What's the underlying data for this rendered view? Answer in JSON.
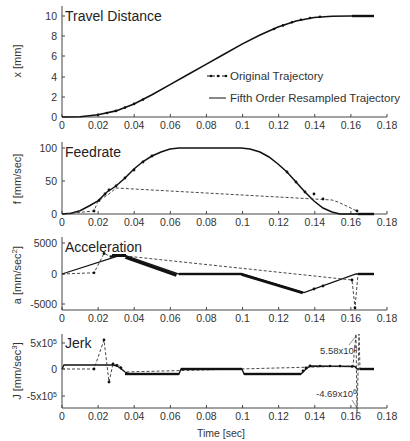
{
  "chart_data": [
    {
      "type": "line",
      "title": "Travel Distance",
      "xlabel": "",
      "ylabel": "x [mm]",
      "xlim": [
        0,
        0.18
      ],
      "ylim": [
        0,
        10.5
      ],
      "xticks": [
        "0",
        "0.02",
        "0.04",
        "0.06",
        "0.08",
        "0.1",
        "0.12",
        "0.14",
        "0.16",
        "0.18"
      ],
      "yticks": [
        "0",
        "2",
        "4",
        "6",
        "8",
        "10"
      ],
      "legend": [
        "Original Trajectory",
        "Fifth Order Resampled Trajectory"
      ],
      "legend_position": "center-right",
      "series": [
        {
          "name": "Original Trajectory",
          "style": "dashed-dot-markers",
          "x": [
            0,
            0.01,
            0.02,
            0.03,
            0.04,
            0.05,
            0.06,
            0.07,
            0.08,
            0.09,
            0.1,
            0.11,
            0.12,
            0.13,
            0.14,
            0.15,
            0.16,
            0.172
          ],
          "y": [
            0,
            0.03,
            0.22,
            0.6,
            1.3,
            2.2,
            3.2,
            4.2,
            5.2,
            6.2,
            7.2,
            8.1,
            8.9,
            9.5,
            9.85,
            9.98,
            10,
            10
          ]
        },
        {
          "name": "Fifth Order Resampled Trajectory",
          "style": "solid",
          "x": [
            0,
            0.01,
            0.02,
            0.03,
            0.04,
            0.05,
            0.06,
            0.07,
            0.08,
            0.09,
            0.1,
            0.11,
            0.12,
            0.13,
            0.14,
            0.15,
            0.16,
            0.172
          ],
          "y": [
            0,
            0.03,
            0.22,
            0.6,
            1.3,
            2.2,
            3.2,
            4.2,
            5.2,
            6.2,
            7.2,
            8.1,
            8.9,
            9.5,
            9.85,
            9.98,
            10,
            10
          ]
        }
      ]
    },
    {
      "type": "line",
      "title": "Feedrate",
      "xlabel": "",
      "ylabel": "f [mm/sec]",
      "xlim": [
        0,
        0.18
      ],
      "ylim": [
        0,
        110
      ],
      "xticks": [
        "0",
        "0.02",
        "0.04",
        "0.06",
        "0.08",
        "0.1",
        "0.12",
        "0.14",
        "0.16",
        "0.18"
      ],
      "yticks": [
        "0",
        "50",
        "100"
      ],
      "series": [
        {
          "name": "Original Trajectory",
          "style": "dashed-dot-markers",
          "x": [
            0,
            0.018,
            0.023,
            0.026,
            0.03,
            0.035,
            0.04,
            0.05,
            0.06,
            0.065,
            0.08,
            0.1,
            0.105,
            0.115,
            0.125,
            0.13,
            0.135,
            0.14,
            0.145,
            0.164,
            0.172
          ],
          "y": [
            0,
            5,
            20,
            30,
            40,
            55,
            70,
            90,
            99,
            100,
            100,
            100,
            98,
            88,
            72,
            62,
            50,
            30,
            22,
            5,
            0
          ]
        },
        {
          "name": "Fifth Order Resampled Trajectory",
          "style": "solid",
          "x": [
            0,
            0.005,
            0.01,
            0.02,
            0.03,
            0.04,
            0.05,
            0.06,
            0.065,
            0.08,
            0.1,
            0.105,
            0.115,
            0.125,
            0.135,
            0.145,
            0.155,
            0.16,
            0.172
          ],
          "y": [
            0,
            1,
            5,
            20,
            42,
            68,
            88,
            99,
            100,
            100,
            100,
            98,
            88,
            70,
            45,
            20,
            5,
            0,
            0
          ]
        }
      ]
    },
    {
      "type": "line",
      "title": "Acceleration",
      "xlabel": "",
      "ylabel": "a [mm/sec²]",
      "xlim": [
        0,
        0.18
      ],
      "ylim": [
        -6000,
        5000
      ],
      "xticks": [
        "0",
        "0.02",
        "0.04",
        "0.06",
        "0.08",
        "0.1",
        "0.12",
        "0.14",
        "0.16",
        "0.18"
      ],
      "yticks": [
        "-5000",
        "0",
        "5000"
      ],
      "series": [
        {
          "name": "Original Trajectory",
          "style": "dashed-dot-markers",
          "x": [
            0,
            0.018,
            0.019,
            0.023,
            0.027,
            0.032,
            0.035,
            0.065,
            0.1,
            0.134,
            0.145,
            0.163,
            0.164,
            0.165,
            0.172
          ],
          "y": [
            0,
            200,
            800,
            3300,
            2800,
            3000,
            3000,
            0,
            0,
            -3000,
            -2200,
            -900,
            -6000,
            0,
            0
          ]
        },
        {
          "name": "Fifth Order Resampled Trajectory",
          "style": "solid",
          "x": [
            0,
            0.032,
            0.035,
            0.065,
            0.1,
            0.134,
            0.163,
            0.172
          ],
          "y": [
            0,
            3000,
            3000,
            0,
            0,
            -3000,
            0,
            0
          ]
        }
      ]
    },
    {
      "type": "line",
      "title": "Jerk",
      "xlabel": "Time [sec]",
      "ylabel": "J [mm/sec³]",
      "xlim": [
        0,
        0.18
      ],
      "ylim": [
        -700000.0,
        700000.0
      ],
      "xticks": [
        "0",
        "0.02",
        "0.04",
        "0.06",
        "0.08",
        "0.1",
        "0.12",
        "0.14",
        "0.16",
        "0.18"
      ],
      "yticks": [
        "-5x10⁵",
        "0",
        "5x10⁵"
      ],
      "annotations": [
        "5.58x10⁶",
        "-4.69x10⁶"
      ],
      "series": [
        {
          "name": "Original Trajectory",
          "style": "dashed-dot-markers",
          "x": [
            0,
            0.018,
            0.023,
            0.026,
            0.029,
            0.032,
            0.037,
            0.065,
            0.066,
            0.1,
            0.101,
            0.132,
            0.137,
            0.16,
            0.163,
            0.164,
            0.165,
            0.166,
            0.172
          ],
          "y": [
            0,
            0,
            550000,
            -250000,
            100000,
            50000,
            -100000,
            -100000,
            0,
            0,
            -100000,
            -100000,
            100000,
            80000,
            5580000,
            -4690000,
            5580000,
            0,
            0
          ]
        },
        {
          "name": "Fifth Order Resampled Trajectory",
          "style": "solid",
          "x": [
            0,
            0.001,
            0.028,
            0.037,
            0.065,
            0.066,
            0.1,
            0.101,
            0.132,
            0.137,
            0.163,
            0.164,
            0.172
          ],
          "y": [
            0,
            100000,
            100000,
            -100000,
            -100000,
            0,
            0,
            -100000,
            -100000,
            100000,
            80000,
            0,
            0
          ]
        }
      ]
    }
  ],
  "panels": {
    "p1": {
      "title": "Travel Distance",
      "ylabel": "x [mm]"
    },
    "p2": {
      "title": "Feedrate",
      "ylabel": "f [mm/sec]"
    },
    "p3": {
      "title": "Acceleration",
      "ylabel": "a [mm/sec²]"
    },
    "p4": {
      "title": "Jerk",
      "ylabel": "J [mm/sec³]",
      "xlabel": "Time [sec]",
      "ann_max": "5.58x10⁶",
      "ann_min": "-4.69x10⁶"
    }
  },
  "legend": {
    "original": "Original Trajectory",
    "resampled": "Fifth Order Resampled Trajectory"
  },
  "xticks": [
    "0",
    "0.02",
    "0.04",
    "0.06",
    "0.08",
    "0.1",
    "0.12",
    "0.14",
    "0.16",
    "0.18"
  ],
  "yticks": {
    "p1": [
      "10",
      "8",
      "6",
      "4",
      "2",
      "0"
    ],
    "p2": [
      "100",
      "50",
      "0"
    ],
    "p3": [
      "5000",
      "0",
      "-5000"
    ],
    "p4": [
      "5x10⁵",
      "0",
      "-5x10⁵"
    ]
  }
}
